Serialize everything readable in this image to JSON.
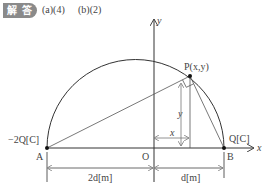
{
  "header": {
    "badge": "解 答",
    "answer_a": "(a)(4)",
    "answer_b": "(b)(2)"
  },
  "diagram": {
    "axis_x_label": "x",
    "axis_y_label": "y",
    "origin_label": "O",
    "point_a_label": "A",
    "point_b_label": "B",
    "point_p_label": "P(x,y)",
    "charge_a": "−2Q[C]",
    "charge_b": "Q[C]",
    "dim_x": "x",
    "dim_y": "y",
    "dist_ao": "2d[m]",
    "dist_ob": "d[m]",
    "line_color": "#333333",
    "gray_color": "#999999"
  }
}
